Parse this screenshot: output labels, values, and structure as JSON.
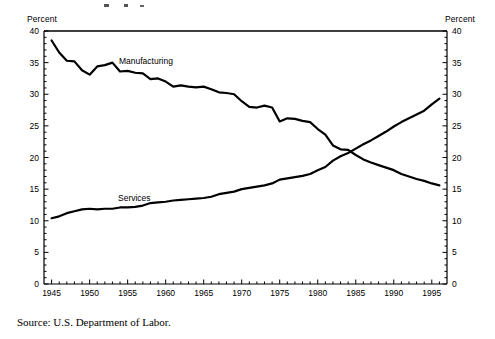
{
  "labels": {
    "left_axis_title": "Percent",
    "right_axis_title": "Percent",
    "source_note": "Source: U.S. Department of Labor.",
    "manufacturing": "Manufacturing",
    "services": "Services"
  },
  "colors": {
    "line": "#000000",
    "axis": "#000000",
    "background": "#ffffff"
  },
  "chart_data": {
    "type": "line",
    "title": "",
    "subtitle": "",
    "xlabel": "",
    "ylabel": "Percent",
    "y2label": "Percent",
    "xlim": [
      1944,
      1997
    ],
    "ylim": [
      0,
      40
    ],
    "yticks": [
      0,
      5,
      10,
      15,
      20,
      25,
      30,
      35,
      40
    ],
    "ytick_labels": [
      "0",
      "5",
      "10",
      "15",
      "20",
      "25",
      "30",
      "35",
      "40"
    ],
    "y2ticks": [
      0,
      5,
      10,
      15,
      20,
      25,
      30,
      35,
      40
    ],
    "y2tick_labels": [
      "0",
      "5",
      "10",
      "15",
      "20",
      "25",
      "30",
      "35",
      "40"
    ],
    "xticks": [
      1945,
      1950,
      1955,
      1960,
      1965,
      1970,
      1975,
      1980,
      1985,
      1990,
      1995
    ],
    "xtick_labels": [
      "1945",
      "1950",
      "1955",
      "1960",
      "1965",
      "1970",
      "1975",
      "1980",
      "1985",
      "1990",
      "1995"
    ],
    "minor_xtick_interval": 1,
    "minor_ytick_interval": 1,
    "grid": false,
    "legend": "inline-annotations",
    "annotations": [
      {
        "text": "Manufacturing",
        "x": 1953.5,
        "y": 34.2
      },
      {
        "text": "Services",
        "x": 1953.0,
        "y": 16.6
      }
    ],
    "crossover": {
      "year": 1983,
      "value": 21.0
    },
    "series": [
      {
        "name": "Manufacturing",
        "x": [
          1945,
          1946,
          1947,
          1948,
          1949,
          1950,
          1951,
          1952,
          1953,
          1954,
          1955,
          1956,
          1957,
          1958,
          1959,
          1960,
          1961,
          1962,
          1963,
          1964,
          1965,
          1966,
          1967,
          1968,
          1969,
          1970,
          1971,
          1972,
          1973,
          1974,
          1975,
          1976,
          1977,
          1978,
          1979,
          1980,
          1981,
          1982,
          1983,
          1984,
          1985,
          1986,
          1987,
          1988,
          1989,
          1990,
          1991,
          1992,
          1993,
          1994,
          1995,
          1996
        ],
        "values": [
          38.5,
          36.6,
          35.3,
          35.2,
          33.8,
          33.1,
          34.4,
          34.6,
          35.0,
          33.6,
          33.7,
          33.4,
          33.3,
          32.4,
          32.5,
          32.0,
          31.2,
          31.4,
          31.2,
          31.1,
          31.2,
          30.8,
          30.3,
          30.2,
          30.0,
          28.9,
          28.0,
          27.9,
          28.2,
          27.9,
          25.7,
          26.2,
          26.1,
          25.8,
          25.6,
          24.5,
          23.6,
          21.9,
          21.3,
          21.2,
          20.4,
          19.7,
          19.2,
          18.8,
          18.4,
          18.0,
          17.4,
          17.0,
          16.6,
          16.3,
          15.9,
          15.6
        ],
        "style": "solid",
        "color": "#000000",
        "linewidth": 2.2
      },
      {
        "name": "Services",
        "x": [
          1945,
          1946,
          1947,
          1948,
          1949,
          1950,
          1951,
          1952,
          1953,
          1954,
          1955,
          1956,
          1957,
          1958,
          1959,
          1960,
          1961,
          1962,
          1963,
          1964,
          1965,
          1966,
          1967,
          1968,
          1969,
          1970,
          1971,
          1972,
          1973,
          1974,
          1975,
          1976,
          1977,
          1978,
          1979,
          1980,
          1981,
          1982,
          1983,
          1984,
          1985,
          1986,
          1987,
          1988,
          1989,
          1990,
          1991,
          1992,
          1993,
          1994,
          1995,
          1996
        ],
        "values": [
          10.4,
          10.7,
          11.2,
          11.5,
          11.8,
          11.9,
          11.8,
          11.9,
          11.9,
          12.1,
          12.1,
          12.2,
          12.4,
          12.8,
          12.9,
          13.0,
          13.2,
          13.3,
          13.4,
          13.5,
          13.6,
          13.8,
          14.2,
          14.4,
          14.6,
          15.0,
          15.2,
          15.4,
          15.6,
          15.9,
          16.5,
          16.7,
          16.9,
          17.1,
          17.4,
          18.0,
          18.5,
          19.5,
          20.2,
          20.7,
          21.4,
          22.1,
          22.7,
          23.4,
          24.1,
          24.9,
          25.6,
          26.2,
          26.8,
          27.4,
          28.4,
          29.3
        ],
        "style": "solid",
        "color": "#000000",
        "linewidth": 2.2
      }
    ]
  }
}
